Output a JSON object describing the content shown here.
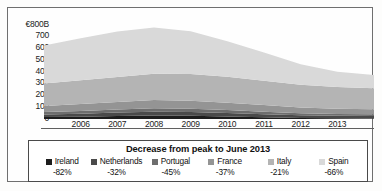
{
  "chart_data": {
    "type": "area",
    "stacked": true,
    "title": "",
    "xlabel": "",
    "ylabel": "€800B",
    "ylim": [
      0,
      800
    ],
    "yticks": [
      800,
      700,
      600,
      500,
      400,
      300,
      200,
      100,
      0
    ],
    "ytick_labels": [
      "€800B",
      "700",
      "600",
      "500",
      "400",
      "300",
      "200",
      "100",
      "0"
    ],
    "grid": false,
    "legend_position": "bottom",
    "legend_title": "Decrease from peak to June 2013",
    "x": [
      2005,
      2006,
      2007,
      2008,
      2009,
      2010,
      2011,
      2012,
      2013,
      2014
    ],
    "xtick_labels": [
      "2006",
      "2007",
      "2008",
      "2009",
      "2010",
      "2011",
      "2012",
      "2013"
    ],
    "xticks": [
      2006,
      2007,
      2008,
      2009,
      2010,
      2011,
      2012,
      2013
    ],
    "series": [
      {
        "name": "Ireland",
        "change_from_peak": "-82%",
        "color": "#1d1d1d",
        "values": [
          16,
          20,
          26,
          30,
          28,
          22,
          14,
          8,
          6,
          5
        ]
      },
      {
        "name": "Netherlands",
        "change_from_peak": "-32%",
        "color": "#4a4a4a",
        "values": [
          22,
          25,
          28,
          31,
          30,
          28,
          26,
          23,
          21,
          20
        ]
      },
      {
        "name": "Portugal",
        "change_from_peak": "-45%",
        "color": "#6e6e6e",
        "values": [
          20,
          23,
          26,
          29,
          28,
          25,
          22,
          18,
          16,
          15
        ]
      },
      {
        "name": "France",
        "change_from_peak": "-37%",
        "color": "#949494",
        "values": [
          52,
          58,
          64,
          70,
          68,
          62,
          56,
          48,
          44,
          42
        ]
      },
      {
        "name": "Italy",
        "change_from_peak": "-21%",
        "color": "#b4b4b4",
        "values": [
          190,
          200,
          210,
          222,
          226,
          218,
          205,
          192,
          182,
          178
        ]
      },
      {
        "name": "Spain",
        "change_from_peak": "-66%",
        "color": "#d9d9d9",
        "values": [
          320,
          355,
          382,
          388,
          360,
          300,
          238,
          172,
          128,
          110
        ]
      }
    ],
    "totals": [
      620,
      681,
      736,
      770,
      740,
      655,
      561,
      461,
      397,
      370
    ]
  }
}
